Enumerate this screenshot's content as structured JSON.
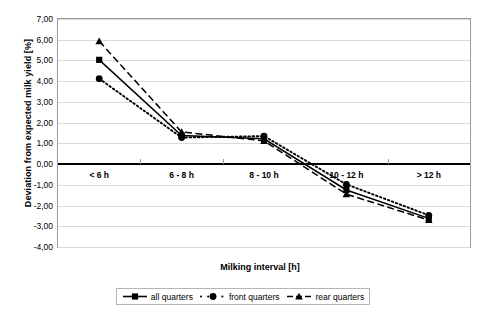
{
  "chart_data": {
    "type": "line",
    "title": "",
    "xlabel": "Milking interval [h]",
    "ylabel": "Deviation from expected milk yield [%]",
    "categories": [
      "< 6 h",
      "6 - 8 h",
      "8 - 10 h",
      "10 - 12 h",
      "> 12 h"
    ],
    "ylim": [
      -4.0,
      7.0
    ],
    "ytick_labels": [
      "7,00",
      "6,00",
      "5,00",
      "4,00",
      "3,00",
      "2,00",
      "1,00",
      "0,00",
      "-1,00",
      "-2,00",
      "-3,00",
      "-4,00"
    ],
    "ytick_values": [
      7.0,
      6.0,
      5.0,
      4.0,
      3.0,
      2.0,
      1.0,
      0.0,
      -1.0,
      -2.0,
      -3.0,
      -4.0
    ],
    "grid": true,
    "legend_position": "bottom",
    "zero_line": 0.0,
    "series": [
      {
        "name": "all quarters",
        "marker": "square",
        "line_style": "solid",
        "color": "#000000",
        "values": [
          5.03,
          1.38,
          1.22,
          -1.25,
          -2.62
        ]
      },
      {
        "name": "front quarters",
        "marker": "circle",
        "line_style": "dotted",
        "color": "#000000",
        "values": [
          4.12,
          1.28,
          1.35,
          -0.98,
          -2.47
        ]
      },
      {
        "name": "rear quarters",
        "marker": "triangle",
        "line_style": "dashed",
        "color": "#000000",
        "values": [
          5.93,
          1.55,
          1.12,
          -1.45,
          -2.7
        ]
      }
    ]
  },
  "legend": {
    "entries": [
      {
        "label": "all quarters"
      },
      {
        "label": "front quarters"
      },
      {
        "label": "rear quarters"
      }
    ]
  }
}
